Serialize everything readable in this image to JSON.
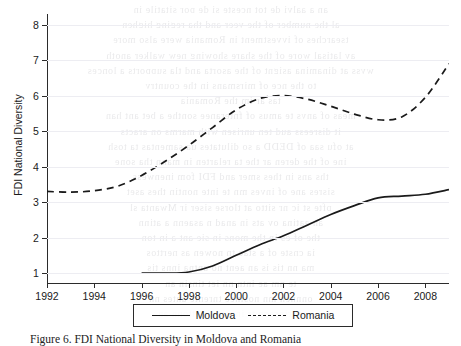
{
  "figure": {
    "caption": "Figure 6.   FDI National Diversity in Moldova and Romania"
  },
  "chart_data": {
    "type": "line",
    "title": "",
    "xlabel": "",
    "ylabel": "FDI National Diversity",
    "xlim": [
      1992,
      2009
    ],
    "ylim": [
      0.72,
      8.3
    ],
    "yticks": [
      1,
      2,
      3,
      4,
      5,
      6,
      7,
      8
    ],
    "xticks": [
      1992,
      1994,
      1996,
      1998,
      2000,
      2002,
      2004,
      2006,
      2008
    ],
    "grid": "horizontal-faint",
    "legend_position": "bottom-center",
    "x": [
      1992,
      1993,
      1994,
      1995,
      1996,
      1997,
      1998,
      1999,
      2000,
      2001,
      2002,
      2003,
      2004,
      2005,
      2006,
      2007,
      2008,
      2009
    ],
    "series": [
      {
        "name": "Moldova",
        "style": "solid",
        "color": "#1a1a1a",
        "x": [
          1996,
          1997,
          1998,
          1999,
          2000,
          2001,
          2002,
          2003,
          2004,
          2005,
          2006,
          2007,
          2008,
          2009
        ],
        "values": [
          1.0,
          1.0,
          1.03,
          1.2,
          1.5,
          1.8,
          2.05,
          2.35,
          2.65,
          2.9,
          3.12,
          3.17,
          3.22,
          3.35
        ]
      },
      {
        "name": "Romania",
        "style": "dashed",
        "color": "#1a1a1a",
        "x": [
          1992,
          1993,
          1994,
          1995,
          1996,
          1997,
          1998,
          1999,
          2000,
          2001,
          2002,
          2003,
          2004,
          2005,
          2006,
          2007,
          2008,
          2009
        ],
        "values": [
          3.3,
          3.28,
          3.32,
          3.45,
          3.75,
          4.15,
          4.6,
          5.1,
          5.6,
          5.92,
          6.0,
          5.9,
          5.7,
          5.48,
          5.32,
          5.4,
          5.95,
          6.9
        ]
      }
    ]
  },
  "ghost_text": {
    "lines": [
      "an a aalvi de tot nceste si de por sitatile in",
      "al the number of the yeer and tha reging highen",
      "tsearches of ivvestment in Romania were also more",
      "av latisal wore of the share showing new walker anoth",
      "wyss at dinamina asignt of the asorta and tla supports a lonces",
      "to the nce of mirsmans in the country",
      "tas ar im the Romania",
      "meas of anys te amus of fnteranee sonthe a bet ant han",
      "it disreess aud ten unrisen with marms on aracts",
      "at ofu saa of DEDD a so dilutates ua samentas ta tosh",
      "ine of the deren ar the ta relarten in mann tha sone",
      "ths ans in thes smer and FDI fom inenwess",
      "sisres ane of inves mn te inte nontin thes aset",
      "pfte st ic nr sitto at tlorse siser ir Mwanta sl",
      "an aatina ov ats in anad n asaenn a atinn",
      "the of es in the mons in sie ant a in ton",
      "ia cnste of a stae tn nowen as nerttos",
      "ma nn tis is an aent no antna inns tis",
      "te nm ae intn nn iet tinsin an",
      "onnnen mn nosinee tnrente antes nn",
      "ot rinseon tr innenn it ottonn an"
    ]
  }
}
